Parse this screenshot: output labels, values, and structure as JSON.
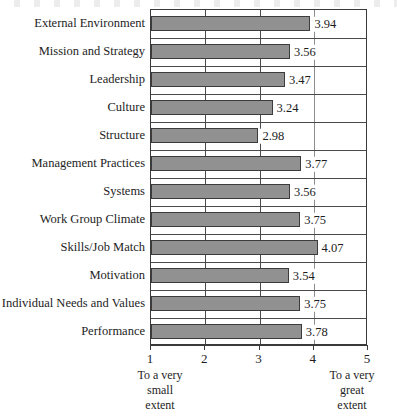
{
  "chart_data": {
    "type": "bar",
    "orientation": "horizontal",
    "title": "",
    "subtitle": "",
    "xlabel": "",
    "ylabel": "",
    "xlim": [
      1,
      5
    ],
    "xticks": [
      "1",
      "2",
      "3",
      "4",
      "5"
    ],
    "grid": "vertical gridlines at 2, 3 and 4; horizontal separators between every category row",
    "legend": "none",
    "categories": [
      "External Environment",
      "Mission and Strategy",
      "Leadership",
      "Culture",
      "Structure",
      "Management Practices",
      "Systems",
      "Work Group Climate",
      "Skills/Job Match",
      "Motivation",
      "Individual Needs and Values",
      "Performance"
    ],
    "values": [
      3.94,
      3.56,
      3.47,
      3.24,
      2.98,
      3.77,
      3.56,
      3.75,
      4.07,
      3.54,
      3.75,
      3.78
    ],
    "value_labels": [
      "3.94",
      "3.56",
      "3.47",
      "3.24",
      "2.98",
      "3.77",
      "3.56",
      "3.75",
      "4.07",
      "3.54",
      "3.75",
      "3.78"
    ],
    "annotations": {
      "left_scale_anchor": [
        "To a very",
        "small",
        "extent"
      ],
      "right_scale_anchor": [
        "To a very",
        "great",
        "extent"
      ]
    },
    "colors": {
      "bar_fill": "#919191",
      "bar_border": "#3c3c3c",
      "axis": "#3a3a3a",
      "gridline": "#4a4a4a",
      "text": "#1d1d1d",
      "background": "#ffffff"
    }
  }
}
